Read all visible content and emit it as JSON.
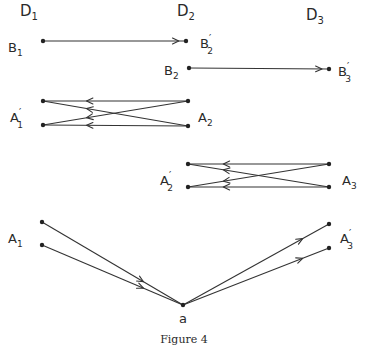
{
  "figure": {
    "caption": "Figure 4",
    "columns": [
      {
        "id": "D1",
        "label": "D",
        "sub": "1",
        "x": 20,
        "y": 16
      },
      {
        "id": "D2",
        "label": "D",
        "sub": "2",
        "x": 177,
        "y": 16
      },
      {
        "id": "D3",
        "label": "D",
        "sub": "3",
        "x": 306,
        "y": 20
      }
    ],
    "points": [
      {
        "id": "B1",
        "x": 43,
        "y": 41
      },
      {
        "id": "B2p",
        "x": 186,
        "y": 41
      },
      {
        "id": "B2",
        "x": 189,
        "y": 68
      },
      {
        "id": "B3p",
        "x": 329,
        "y": 69
      },
      {
        "id": "A1p_top",
        "x": 43,
        "y": 101
      },
      {
        "id": "A1p_bot",
        "x": 43,
        "y": 125
      },
      {
        "id": "A2_top",
        "x": 188,
        "y": 101
      },
      {
        "id": "A2_bot",
        "x": 188,
        "y": 126
      },
      {
        "id": "A2p_top",
        "x": 188,
        "y": 164
      },
      {
        "id": "A2p_bot",
        "x": 188,
        "y": 187
      },
      {
        "id": "A3_top",
        "x": 329,
        "y": 164
      },
      {
        "id": "A3_bot",
        "x": 329,
        "y": 187
      },
      {
        "id": "A1_top",
        "x": 42,
        "y": 222
      },
      {
        "id": "A1_bot",
        "x": 42,
        "y": 245
      },
      {
        "id": "a",
        "x": 183,
        "y": 305
      },
      {
        "id": "A3p_top",
        "x": 329,
        "y": 224
      },
      {
        "id": "A3p_bot",
        "x": 329,
        "y": 248
      }
    ],
    "labels": [
      {
        "id": "B1",
        "text": "B",
        "sub": "1",
        "prime": false,
        "x": 8,
        "y": 52
      },
      {
        "id": "B2p",
        "text": "B",
        "sub": "2",
        "prime": true,
        "x": 200,
        "y": 48
      },
      {
        "id": "B2",
        "text": "B",
        "sub": "2",
        "prime": false,
        "x": 164,
        "y": 75
      },
      {
        "id": "B3p",
        "text": "B",
        "sub": "3",
        "prime": true,
        "x": 338,
        "y": 76
      },
      {
        "id": "A1p",
        "text": "A",
        "sub": "1",
        "prime": true,
        "x": 10,
        "y": 122
      },
      {
        "id": "A2",
        "text": "A",
        "sub": "2",
        "prime": false,
        "x": 198,
        "y": 122
      },
      {
        "id": "A2p",
        "text": "A",
        "sub": "2",
        "prime": true,
        "x": 160,
        "y": 185
      },
      {
        "id": "A3",
        "text": "A",
        "sub": "3",
        "prime": false,
        "x": 342,
        "y": 185
      },
      {
        "id": "A1",
        "text": "A",
        "sub": "1",
        "prime": false,
        "x": 8,
        "y": 243
      },
      {
        "id": "A3p",
        "text": "A",
        "sub": "3",
        "prime": true,
        "x": 340,
        "y": 243
      },
      {
        "id": "a",
        "text": "a",
        "sub": "",
        "prime": false,
        "x": 179,
        "y": 323
      }
    ],
    "edges": [
      {
        "from": "B1",
        "to": "B2p",
        "arrow_at": 0.95
      },
      {
        "from": "B2",
        "to": "B3p",
        "arrow_at": 0.95
      },
      {
        "from": "A2_top",
        "to": "A1p_top",
        "arrow_at": 0.7
      },
      {
        "from": "A2_bot",
        "to": "A1p_top",
        "arrow_at": 0.7
      },
      {
        "from": "A2_top",
        "to": "A1p_bot",
        "arrow_at": 0.7
      },
      {
        "from": "A2_bot",
        "to": "A1p_bot",
        "arrow_at": 0.7
      },
      {
        "from": "A3_top",
        "to": "A2p_top",
        "arrow_at": 0.75
      },
      {
        "from": "A3_bot",
        "to": "A2p_top",
        "arrow_at": 0.75
      },
      {
        "from": "A3_top",
        "to": "A2p_bot",
        "arrow_at": 0.75
      },
      {
        "from": "A3_bot",
        "to": "A2p_bot",
        "arrow_at": 0.75
      },
      {
        "from": "A1_top",
        "to": "a",
        "arrow_at": 0.72
      },
      {
        "from": "A1_bot",
        "to": "a",
        "arrow_at": 0.72
      },
      {
        "from": "a",
        "to": "A3p_top",
        "arrow_at": 0.82
      },
      {
        "from": "a",
        "to": "A3p_bot",
        "arrow_at": 0.82
      }
    ]
  }
}
